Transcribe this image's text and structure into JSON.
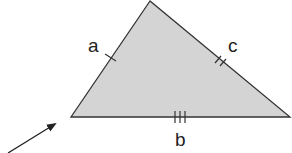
{
  "diagram": {
    "type": "triangle",
    "fill_color": "#d4d4d4",
    "stroke_color": "#333333",
    "vertices": {
      "apex": [
        150,
        1
      ],
      "bottom_left": [
        71,
        117
      ],
      "bottom_right": [
        290,
        117
      ]
    },
    "sides": [
      {
        "label": "a",
        "ticks": 1,
        "position": "left side"
      },
      {
        "label": "c",
        "ticks": 2,
        "position": "right side"
      },
      {
        "label": "b",
        "ticks": 3,
        "position": "base"
      }
    ],
    "arrow": {
      "from": [
        8,
        153
      ],
      "to": [
        56,
        123
      ],
      "points_to": "bottom-left vertex"
    }
  }
}
